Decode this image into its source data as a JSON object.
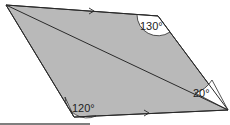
{
  "diagram": {
    "shape": "parallelogram with diagonal",
    "angles": {
      "top_right": "130°",
      "bottom_left": "120°",
      "right_diagonal": "20°"
    },
    "colors": {
      "fill": "#b8b8b8",
      "stroke": "#2a2a2a",
      "angle_fill": "#ffffff"
    }
  }
}
